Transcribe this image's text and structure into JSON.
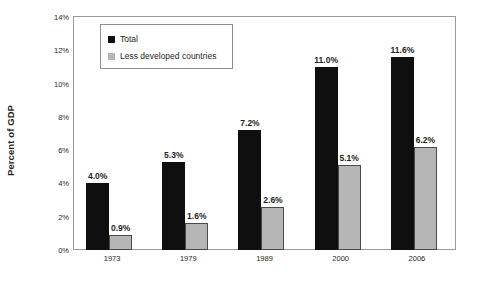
{
  "chart_data": {
    "type": "bar",
    "title": "",
    "xlabel": "",
    "ylabel": "Percent of GDP",
    "categories": [
      "1973",
      "1979",
      "1989",
      "2000",
      "2006"
    ],
    "series": [
      {
        "name": "Total",
        "color": "#100f0f",
        "values": [
          4.0,
          5.3,
          7.2,
          11.0,
          11.6
        ],
        "labels": [
          "4.0%",
          "5.3%",
          "7.2%",
          "11.0%",
          "11.6%"
        ]
      },
      {
        "name": "Less developed countries",
        "color": "#b6b6b6",
        "values": [
          0.9,
          1.6,
          2.6,
          5.1,
          6.2
        ],
        "labels": [
          "0.9%",
          "1.6%",
          "2.6%",
          "5.1%",
          "6.2%"
        ]
      }
    ],
    "ylim": [
      0,
      14
    ],
    "ytick_values": [
      0,
      2,
      4,
      6,
      8,
      10,
      12,
      14
    ],
    "ytick_labels": [
      "0%",
      "2%",
      "4%",
      "6%",
      "8%",
      "10%",
      "12%",
      "14%"
    ],
    "grid": false,
    "legend_position": "top-left",
    "legend_entries": [
      "Total",
      "Less developed countries"
    ]
  },
  "axis": {
    "y_title": "Percent of GDP"
  },
  "legend": {
    "items": [
      {
        "label": "Total"
      },
      {
        "label": "Less developed countries"
      }
    ]
  }
}
